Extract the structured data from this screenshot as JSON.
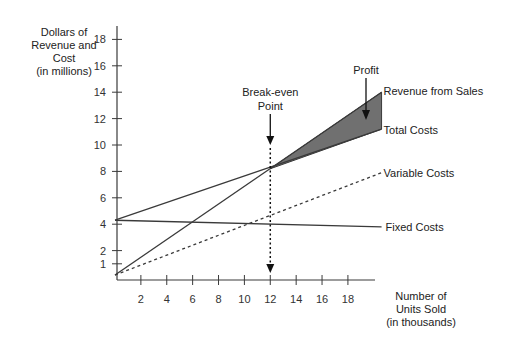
{
  "chart_data": {
    "type": "line",
    "title": "",
    "xlabel": "Number of Units Sold (in thousands)",
    "ylabel": "Dollars of Revenue and Cost (in millions)",
    "xlabel_lines": [
      "Number of",
      "Units Sold",
      "(in thousands)"
    ],
    "ylabel_lines": [
      "Dollars of",
      "Revenue and",
      "Cost",
      "(in millions)"
    ],
    "x_ticks": [
      2,
      4,
      6,
      8,
      10,
      12,
      14,
      16,
      18
    ],
    "y_ticks": [
      1,
      2,
      4,
      6,
      8,
      10,
      12,
      14,
      16,
      18
    ],
    "xlim": [
      0,
      20.6
    ],
    "ylim": [
      0,
      19
    ],
    "grid": false,
    "series": [
      {
        "name": "Revenue from Sales",
        "style": "solid",
        "x": [
          0,
          20.6
        ],
        "y": [
          0.15,
          14.0
        ]
      },
      {
        "name": "Total Costs",
        "style": "solid",
        "x": [
          0,
          20.6
        ],
        "y": [
          4.3,
          11.2
        ]
      },
      {
        "name": "Variable Costs",
        "style": "dashed",
        "x": [
          0,
          20.6
        ],
        "y": [
          0.15,
          7.9
        ]
      },
      {
        "name": "Fixed Costs",
        "style": "solid",
        "x": [
          0,
          20.6
        ],
        "y": [
          4.3,
          3.8
        ]
      }
    ],
    "annotations": [
      {
        "text": "Break-even Point",
        "lines": [
          "Break-even",
          "Point"
        ],
        "x": 12,
        "y": 8.2
      },
      {
        "text": "Profit",
        "x": 19,
        "y": 12.3,
        "note": "shaded region between Revenue from Sales and Total Costs beyond break-even"
      }
    ],
    "break_even": {
      "units": 12,
      "dollars": 8.2
    },
    "colors": {
      "line": "#3a3a3a",
      "profit_fill": "#707070",
      "text": "#222222"
    }
  }
}
